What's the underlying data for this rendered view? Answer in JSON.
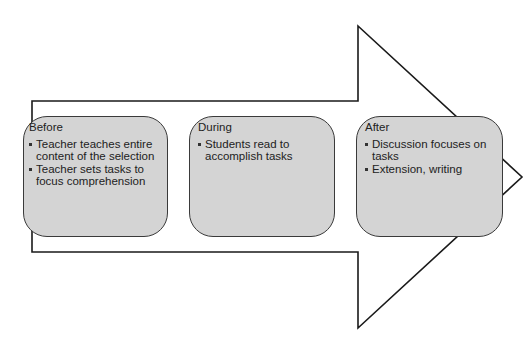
{
  "diagram": {
    "type": "process-arrow",
    "arrow": {
      "stroke_color": "#1a1a1a",
      "fill_color": "#ffffff"
    },
    "box_fill_color": "#d4d4d4",
    "box_border_color": "#3a3a3a",
    "stages": [
      {
        "title": "Before",
        "bullets": [
          "Teacher teaches entire content of the selection",
          "Teacher sets tasks to focus comprehension"
        ]
      },
      {
        "title": "During",
        "bullets": [
          "Students read to accomplish tasks"
        ]
      },
      {
        "title": "After",
        "bullets": [
          "Discussion focuses on tasks",
          "Extension, writing"
        ]
      }
    ]
  }
}
